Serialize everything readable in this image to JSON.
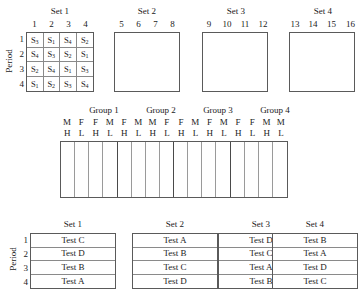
{
  "top_section": {
    "period_label": "Period",
    "row_numbers": [
      "1",
      "2",
      "3",
      "4"
    ],
    "sets": [
      {
        "title": "Set 1",
        "column_headers": [
          "1",
          "2",
          "3",
          "4"
        ],
        "filled": true,
        "rows": [
          [
            "S3",
            "S1",
            "S4",
            "S2"
          ],
          [
            "S4",
            "S3",
            "S2",
            "S1"
          ],
          [
            "S2",
            "S4",
            "S1",
            "S3"
          ],
          [
            "S1",
            "S2",
            "S3",
            "S4"
          ]
        ]
      },
      {
        "title": "Set 2",
        "column_headers": [
          "5",
          "6",
          "7",
          "8"
        ],
        "filled": false,
        "rows": []
      },
      {
        "title": "Set 3",
        "column_headers": [
          "9",
          "10",
          "11",
          "12"
        ],
        "filled": false,
        "rows": []
      },
      {
        "title": "Set 4",
        "column_headers": [
          "13",
          "14",
          "15",
          "16"
        ],
        "filled": false,
        "rows": []
      }
    ]
  },
  "middle_section": {
    "groups": [
      {
        "title": "Group 1",
        "sex": [
          "M",
          "F",
          "F",
          "M"
        ],
        "level": [
          "H",
          "L",
          "H",
          "L"
        ]
      },
      {
        "title": "Group 2",
        "sex": [
          "F",
          "M",
          "M",
          "F"
        ],
        "level": [
          "H",
          "L",
          "H",
          "L"
        ]
      },
      {
        "title": "Group 3",
        "sex": [
          "F",
          "M",
          "F",
          "M"
        ],
        "level": [
          "H",
          "L",
          "H",
          "L"
        ]
      },
      {
        "title": "Group 4",
        "sex": [
          "F",
          "F",
          "M",
          "M"
        ],
        "level": [
          "H",
          "L",
          "H",
          "L"
        ]
      }
    ],
    "column_count": 16,
    "cells_empty": true
  },
  "bottom_section": {
    "period_label": "Period",
    "row_numbers": [
      "1",
      "2",
      "3",
      "4"
    ],
    "sets": [
      {
        "title": "Set 1",
        "cells": [
          "Test C",
          "Test D",
          "Test B",
          "Test A"
        ]
      },
      {
        "title": "Set 2",
        "cells": [
          "Test A",
          "Test B",
          "Test C",
          "Test D"
        ]
      },
      {
        "title": "Set 3",
        "cells": [
          "Test D",
          "Test C",
          "Test A",
          "Test B"
        ]
      },
      {
        "title": "Set 4",
        "cells": [
          "Test B",
          "Test A",
          "Test D",
          "Test C"
        ]
      }
    ]
  },
  "colors": {
    "background": "#ffffff",
    "text": "#1a1a1a",
    "border_outer": "#5a5a5a",
    "border_inner": "#8a8a8a"
  }
}
